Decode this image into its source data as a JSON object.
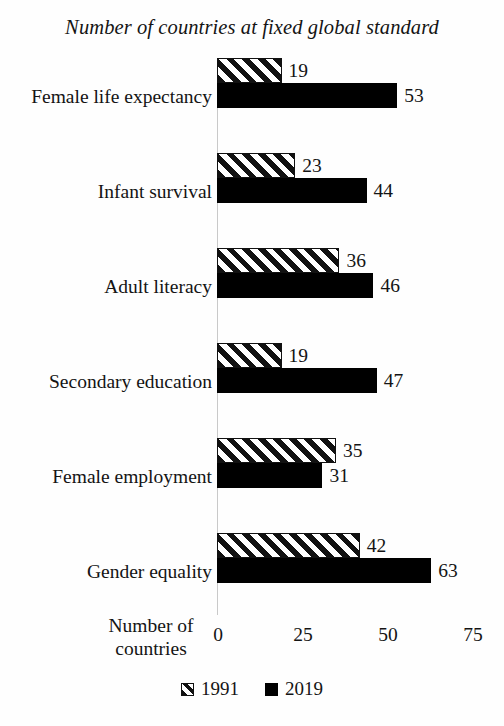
{
  "chart_data": {
    "type": "bar",
    "orientation": "horizontal",
    "title": "Number of countries at fixed global standard",
    "xlabel": "Number of countries",
    "ylabel": "",
    "xlim": [
      0,
      75
    ],
    "xticks": [
      0,
      25,
      50,
      75
    ],
    "xtick_labels": [
      "0",
      "25",
      "50",
      "75"
    ],
    "grid": false,
    "legend_position": "bottom-center",
    "categories": [
      "Female life expectancy",
      "Infant survival",
      "Adult literacy",
      "Secondary education",
      "Female employment",
      "Gender equality"
    ],
    "series": [
      {
        "name": "1991",
        "style": "hatched",
        "values": [
          19,
          23,
          36,
          19,
          35,
          42
        ]
      },
      {
        "name": "2019",
        "style": "solid-black",
        "values": [
          53,
          44,
          46,
          47,
          31,
          63
        ]
      }
    ]
  },
  "axis": {
    "y_title_line1": "Number of",
    "y_title_line2": "countries"
  },
  "colors": {
    "background": "#fefefe",
    "text": "#141414",
    "series_2019": "#000000",
    "series_1991_stroke": "#111111",
    "axis_line": "#c9c9c9"
  }
}
